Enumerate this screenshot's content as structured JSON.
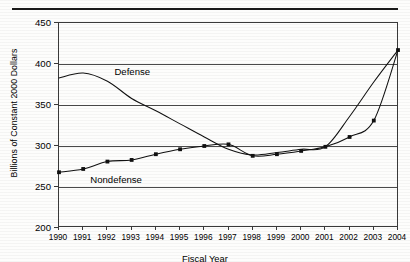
{
  "chart_data": {
    "type": "line",
    "title": "",
    "xlabel": "Fiscal Year",
    "ylabel": "Billions of Constant 2000 Dollars",
    "categories": [
      1990,
      1991,
      1992,
      1993,
      1994,
      1995,
      1996,
      1997,
      1998,
      1999,
      2000,
      2001,
      2002,
      2003,
      2004
    ],
    "x_tick_labels": [
      "1990",
      "1991",
      "1992",
      "1993",
      "1994",
      "1995",
      "1996",
      "1997",
      "1998",
      "1999",
      "2000",
      "2001",
      "2002",
      "2003",
      "2004"
    ],
    "y_tick_labels": [
      "200",
      "250",
      "300",
      "350",
      "400",
      "450"
    ],
    "y_ticks": [
      200,
      250,
      300,
      350,
      400,
      450
    ],
    "ylim": [
      200,
      450
    ],
    "xlim": [
      1990,
      2004
    ],
    "grid": true,
    "grid_axis": "y",
    "legend": "inline-labels",
    "series": [
      {
        "name": "Defense",
        "marker": "none",
        "label_text": "Defense",
        "values": [
          383,
          389,
          379,
          358,
          343,
          327,
          311,
          296,
          289,
          292,
          296,
          299,
          336,
          378,
          417
        ]
      },
      {
        "name": "Nondefense",
        "marker": "square",
        "label_text": "Nondefense",
        "values": [
          268,
          272,
          281,
          283,
          290,
          296,
          300,
          302,
          288,
          290,
          294,
          299,
          311,
          331,
          417
        ]
      }
    ],
    "annotations": [
      {
        "text": "Defense",
        "series": "Defense"
      },
      {
        "text": "Nondefense",
        "series": "Nondefense"
      }
    ]
  }
}
